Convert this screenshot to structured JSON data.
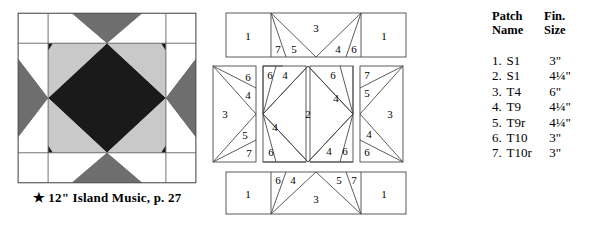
{
  "block": {
    "caption": "★ 12\" Island Music, p. 27",
    "size_label": "12\"",
    "name": "Island Music",
    "page_ref": "p. 27",
    "colors": {
      "background": "#ffffff",
      "dark": "#1a1a1a",
      "medium": "#6e6e6e",
      "light": "#c9c9c9",
      "outline": "#555555"
    }
  },
  "patch_table": {
    "headers": {
      "name_line1": "Patch",
      "name_line2": "Name",
      "size_line1": "Fin.",
      "size_line2": "Size"
    },
    "rows": [
      {
        "num": "1.",
        "name": "S1",
        "size": "3\""
      },
      {
        "num": "2.",
        "name": "S1",
        "size": "4¼\""
      },
      {
        "num": "3.",
        "name": "T4",
        "size": "6\""
      },
      {
        "num": "4.",
        "name": "T9",
        "size": "4¼\""
      },
      {
        "num": "5.",
        "name": "T9r",
        "size": "4¼\""
      },
      {
        "num": "6.",
        "name": "T10",
        "size": "3\""
      },
      {
        "num": "7.",
        "name": "T10r",
        "size": "3\""
      }
    ]
  },
  "diagrams": {
    "top_strip": {
      "labels": [
        "1",
        "7",
        "5",
        "3",
        "4",
        "6",
        "1"
      ]
    },
    "middle_left": {
      "labels": [
        "6",
        "4",
        "3",
        "5",
        "7"
      ]
    },
    "middle_center": {
      "labels": [
        "6",
        "4",
        "6",
        "4",
        "2",
        "4",
        "6",
        "4",
        "6"
      ]
    },
    "middle_right": {
      "labels": [
        "7",
        "5",
        "3",
        "4",
        "6"
      ]
    },
    "bottom_strip": {
      "labels": [
        "1",
        "6",
        "4",
        "3",
        "5",
        "7",
        "1"
      ]
    }
  },
  "diagram_labels": {
    "t_1": "1",
    "t_7": "7",
    "t_5": "5",
    "t_3": "3",
    "t_4": "4",
    "t_6": "6",
    "t_1b": "1",
    "ml_6": "6",
    "ml_4": "4",
    "ml_3": "3",
    "ml_5": "5",
    "ml_7": "7",
    "mc_6a": "6",
    "mc_4a": "4",
    "mc_6b": "6",
    "mc_4b": "4",
    "mc_2": "2",
    "mc_4c": "4",
    "mc_6c": "6",
    "mc_4d": "4",
    "mc_6d": "6",
    "mr_7": "7",
    "mr_5": "5",
    "mr_3": "3",
    "mr_4": "4",
    "mr_6": "6",
    "b_1": "1",
    "b_6": "6",
    "b_4": "4",
    "b_3": "3",
    "b_5": "5",
    "b_7": "7",
    "b_1b": "1"
  }
}
